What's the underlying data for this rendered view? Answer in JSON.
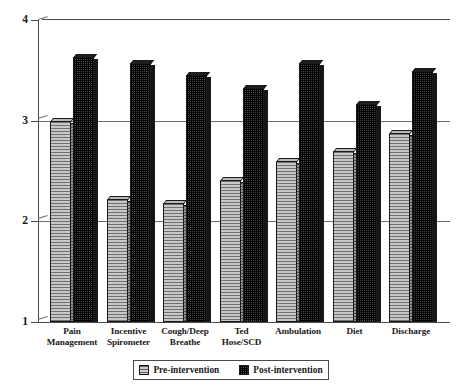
{
  "chart_data": {
    "type": "bar",
    "title": "",
    "subtitle": "",
    "xlabel": "",
    "ylabel": "",
    "ylim": [
      1,
      4
    ],
    "yticks": [
      "1",
      "2",
      "3",
      "4"
    ],
    "ytick_values": [
      1,
      2,
      3,
      4
    ],
    "grid": "horizontal",
    "legend_position": "bottom-center",
    "categories": [
      "Pain Management",
      "Incentive Spirometer",
      "Cough/Deep Breathe",
      "Ted Hose/SCD",
      "Ambulation",
      "Diet",
      "Discharge"
    ],
    "category_lines": [
      [
        "Pain",
        "Management"
      ],
      [
        "Incentive",
        "Spirometer"
      ],
      [
        "Cough/Deep",
        "Breathe"
      ],
      [
        "Ted",
        "Hose/SCD"
      ],
      [
        "Ambulation",
        ""
      ],
      [
        "Diet",
        ""
      ],
      [
        "Discharge",
        ""
      ]
    ],
    "series": [
      {
        "name": "Pre-intervention",
        "color": "#a8a8a8",
        "pattern": "horizontal-hatch",
        "values": [
          3.0,
          2.22,
          2.18,
          2.41,
          2.6,
          2.7,
          2.88
        ]
      },
      {
        "name": "Post-intervention",
        "color": "#2b2b2b",
        "pattern": "checkered",
        "values": [
          3.63,
          3.57,
          3.45,
          3.32,
          3.57,
          3.17,
          3.49
        ]
      }
    ]
  },
  "legend": {
    "items": [
      {
        "label": "Pre-intervention",
        "swatch": "pre"
      },
      {
        "label": "Post-intervention",
        "swatch": "post"
      }
    ]
  },
  "colors": {
    "axis": "#4a4a4a",
    "grid": "#6d6d6d",
    "pre_bar": "#a8a8a8",
    "post_bar": "#2b2b2b",
    "text": "#1a1a1a",
    "background": "#ffffff"
  }
}
